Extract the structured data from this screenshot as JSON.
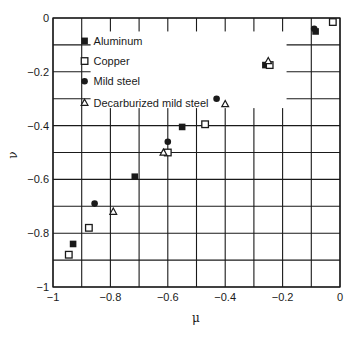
{
  "chart_data": {
    "type": "scatter",
    "title": "",
    "xlabel": "μ",
    "ylabel": "ν",
    "xlim": [
      -1,
      0
    ],
    "ylim": [
      -1,
      0
    ],
    "grid": true,
    "x_ticks": [
      -1,
      -0.9,
      -0.8,
      -0.7,
      -0.6,
      -0.5,
      -0.4,
      -0.3,
      -0.2,
      -0.1,
      0
    ],
    "y_ticks": [
      -1,
      -0.9,
      -0.8,
      -0.7,
      -0.6,
      -0.5,
      -0.4,
      -0.3,
      -0.2,
      -0.1,
      0
    ],
    "x_tick_labels": [
      "−1",
      "−0.8",
      "−0.6",
      "−0.4",
      "−0.2",
      "0"
    ],
    "x_tick_label_values": [
      -1,
      -0.8,
      -0.6,
      -0.4,
      -0.2,
      0
    ],
    "y_tick_labels": [
      "0",
      "−0.2",
      "−0.4",
      "−0.6",
      "−0.8",
      "−1"
    ],
    "y_tick_label_values": [
      0,
      -0.2,
      -0.4,
      -0.6,
      -0.8,
      -1
    ],
    "legend_position": "upper-left (inside)",
    "series": [
      {
        "name": "Aluminum",
        "marker": "filled-square",
        "points": [
          [
            -0.93,
            -0.84
          ],
          [
            -0.715,
            -0.59
          ],
          [
            -0.55,
            -0.405
          ],
          [
            -0.26,
            -0.175
          ],
          [
            -0.085,
            -0.05
          ]
        ]
      },
      {
        "name": "Copper",
        "marker": "open-square",
        "points": [
          [
            -0.945,
            -0.88
          ],
          [
            -0.875,
            -0.78
          ],
          [
            -0.6,
            -0.5
          ],
          [
            -0.47,
            -0.395
          ],
          [
            -0.245,
            -0.175
          ],
          [
            -0.025,
            -0.015
          ]
        ]
      },
      {
        "name": "Mild steel",
        "marker": "filled-circle",
        "points": [
          [
            -0.855,
            -0.69
          ],
          [
            -0.6,
            -0.46
          ],
          [
            -0.43,
            -0.3
          ],
          [
            -0.09,
            -0.04
          ]
        ]
      },
      {
        "name": "Decarburized mild steel",
        "marker": "open-triangle",
        "points": [
          [
            -0.79,
            -0.72
          ],
          [
            -0.615,
            -0.5
          ],
          [
            -0.4,
            -0.32
          ],
          [
            -0.25,
            -0.16
          ]
        ]
      }
    ]
  },
  "legend": {
    "items": [
      "Aluminum",
      "Copper",
      "Mild steel",
      "Decarburized mild steel"
    ]
  },
  "axes": {
    "x_label": "μ",
    "y_label": "ν"
  }
}
